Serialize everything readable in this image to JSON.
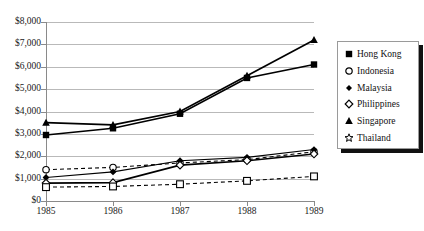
{
  "chart_data": {
    "type": "line",
    "title": "",
    "xlabel": "",
    "ylabel": "",
    "x": [
      1985,
      1986,
      1987,
      1988,
      1989
    ],
    "categories": [
      "1985",
      "1986",
      "1987",
      "1988",
      "1989"
    ],
    "xtick_labels": [
      "1985",
      "1986",
      "1987",
      "1988",
      "1989"
    ],
    "ytick_labels": [
      "$0",
      "$1,000",
      "$2,000",
      "$3,000",
      "$4,000",
      "$5,000",
      "$6,000",
      "$7,000",
      "$8,000"
    ],
    "ytick_values": [
      0,
      1000,
      2000,
      3000,
      4000,
      5000,
      6000,
      7000,
      8000
    ],
    "ylim": [
      0,
      8000
    ],
    "xlim": [
      1985,
      1989
    ],
    "grid": true,
    "legend_position": "right",
    "series": [
      {
        "name": "Hong Kong",
        "marker": "filled-square",
        "line": "solid",
        "values": [
          2950,
          3250,
          3900,
          5500,
          6100
        ]
      },
      {
        "name": "Indonesia",
        "marker": "open-circle",
        "line": "dashed",
        "values": [
          1400,
          1500,
          1700,
          1850,
          2200
        ]
      },
      {
        "name": "Malaysia",
        "marker": "filled-diamond",
        "line": "solid",
        "values": [
          1050,
          1300,
          1800,
          1950,
          2300
        ]
      },
      {
        "name": "Philippines",
        "marker": "open-diamond",
        "line": "solid",
        "values": [
          800,
          820,
          1600,
          1800,
          2100
        ]
      },
      {
        "name": "Singapore",
        "marker": "filled-triangle",
        "line": "solid",
        "values": [
          3500,
          3400,
          4000,
          5600,
          7200
        ]
      },
      {
        "name": "Thailand",
        "marker": "open-square",
        "line": "dashed",
        "values": [
          620,
          650,
          750,
          900,
          1100
        ]
      }
    ]
  },
  "legend": {
    "items": [
      {
        "label": "Hong Kong",
        "marker": "filled-square"
      },
      {
        "label": "Indonesia",
        "marker": "open-circle"
      },
      {
        "label": "Malaysia",
        "marker": "filled-diamond"
      },
      {
        "label": "Philippines",
        "marker": "open-diamond"
      },
      {
        "label": "Singapore",
        "marker": "filled-triangle"
      },
      {
        "label": "Thailand",
        "marker": "open-star"
      }
    ]
  },
  "colors": {
    "series": "#000000",
    "grid": "#b9b9b9",
    "axis": "#8a8a8a",
    "background": "#ffffff",
    "text": "#1a1a1a"
  }
}
